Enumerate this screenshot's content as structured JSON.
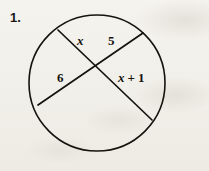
{
  "exercise": {
    "number": "1."
  },
  "figure": {
    "type": "circle-with-two-intersecting-chords",
    "stroke_color": "#15130f",
    "background_color": "#f3f1ec",
    "circle": {
      "center_x": 97,
      "center_y": 83,
      "radius": 68
    },
    "intersection_point": {
      "x": 97,
      "y": 70
    },
    "chords": [
      {
        "name": "chord-upper-left-to-lower-right",
        "x1": 58,
        "y1": 30,
        "x2": 152,
        "y2": 120,
        "segments": [
          "x",
          "x + 1"
        ]
      },
      {
        "name": "chord-upper-right-to-lower-left",
        "x1": 143,
        "y1": 33,
        "x2": 38,
        "y2": 105,
        "segments": [
          "5",
          "6"
        ]
      }
    ]
  },
  "labels": {
    "segment_x": "x",
    "segment_five": "5",
    "segment_six": "6",
    "segment_x_plus_1": {
      "variable": "x",
      "operator": "+",
      "addend": "1"
    }
  }
}
